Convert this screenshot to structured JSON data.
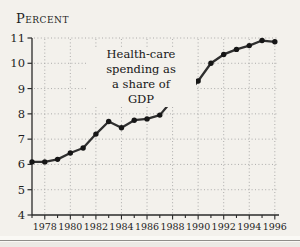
{
  "figure": {
    "axis_title": "Percent",
    "annotation": {
      "lines": [
        "Health-care",
        "spending as",
        "a share of",
        "GDP"
      ]
    },
    "colors": {
      "background": "#f3f1ec",
      "axis": "#2a2a2a",
      "grid": "#9a9a9a",
      "line": "#2f2f2f",
      "marker": "#161616",
      "text": "#1e1e1e"
    }
  },
  "chart_data": {
    "type": "line",
    "title": "",
    "ylabel": "Percent",
    "xlabel": "",
    "annotation": "Health-care spending as a share of GDP",
    "x": [
      1977,
      1978,
      1979,
      1980,
      1981,
      1982,
      1983,
      1984,
      1985,
      1986,
      1987,
      1988,
      1989,
      1990,
      1991,
      1992,
      1993,
      1994,
      1995,
      1996
    ],
    "values": [
      6.1,
      6.1,
      6.2,
      6.45,
      6.65,
      7.2,
      7.7,
      7.45,
      7.75,
      7.8,
      7.95,
      8.55,
      8.7,
      9.3,
      10.0,
      10.35,
      10.55,
      10.7,
      10.9,
      10.85
    ],
    "ylim": [
      4,
      11
    ],
    "xlim": [
      1977,
      1996
    ],
    "y_ticks": [
      4,
      5,
      6,
      7,
      8,
      9,
      10,
      11
    ],
    "x_tick_labels": [
      "1978",
      "1980",
      "1982",
      "1984",
      "1986",
      "1988",
      "1990",
      "1992",
      "1994",
      "1996"
    ],
    "grid": "dotted",
    "legend": "none",
    "marker": "filled-circle"
  }
}
